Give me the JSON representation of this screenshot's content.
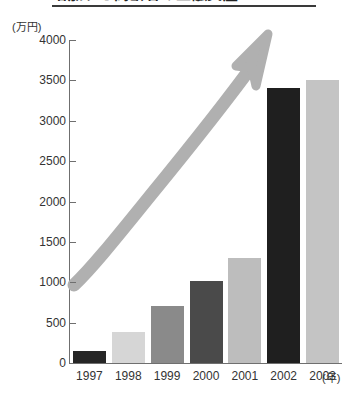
{
  "chart_data": {
    "type": "bar",
    "title": "増加する高齢者の金融資産",
    "categories": [
      "1997",
      "1998",
      "1999",
      "2000",
      "2001",
      "2002",
      "2003"
    ],
    "values": [
      150,
      380,
      700,
      1010,
      1300,
      3400,
      3500
    ],
    "xlabel": "(年)",
    "ylabel": "(万円)",
    "ylim": [
      0,
      4000
    ],
    "ytick_step": 500,
    "yticks": [
      "0",
      "500",
      "1000",
      "1500",
      "2000",
      "2500",
      "3000",
      "3500",
      "4000"
    ],
    "grid": false,
    "legend": "none",
    "bar_colors": [
      "#262626",
      "#d6d6d6",
      "#8a8a8a",
      "#4a4a4a",
      "#bdbdbd",
      "#1f1f1f",
      "#c4c4c4"
    ],
    "annotations": [
      {
        "name": "growth-arrow",
        "type": "curved-arrow",
        "color": "#b0b0b0",
        "direction": "upward-right"
      }
    ]
  },
  "axis": {
    "unit_caption": "(万円)",
    "x_unit_caption": "(年)"
  },
  "colors": {
    "axis": "#6f6f6f",
    "text": "#333333",
    "title_rule": "#3a3a3a",
    "arrow": "#b0b0b0",
    "background": "#ffffff"
  }
}
